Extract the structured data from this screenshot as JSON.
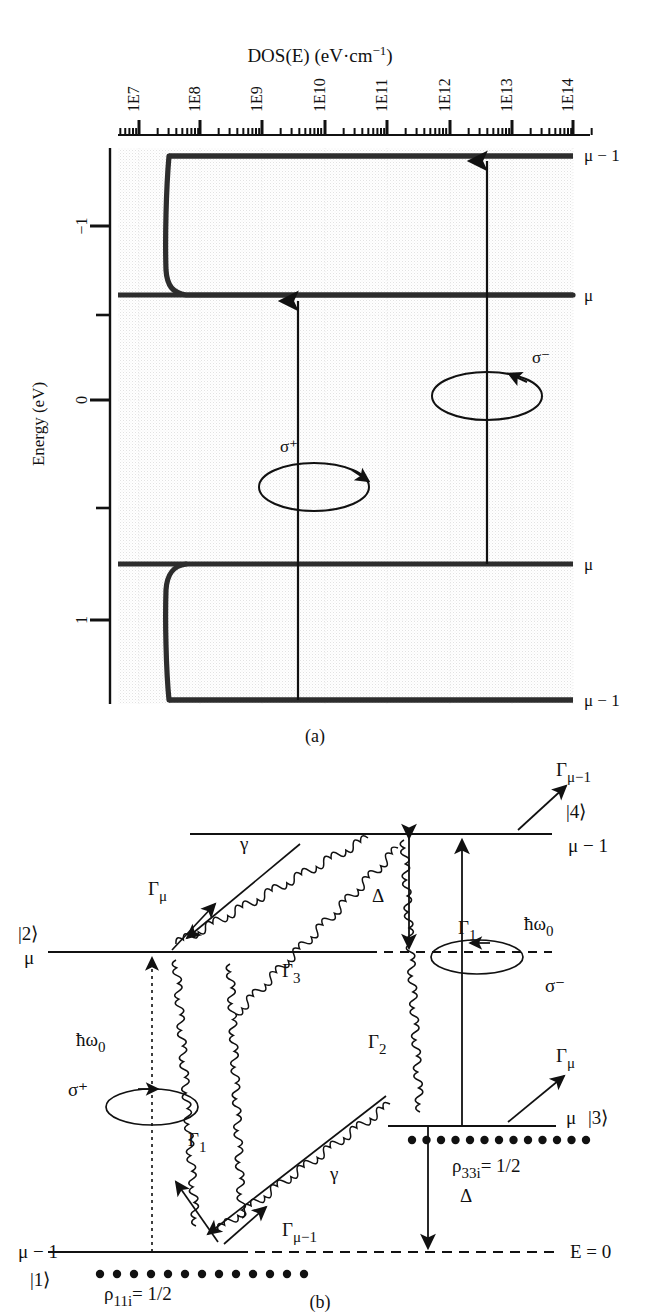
{
  "figure": {
    "panel_a_caption": "(a)",
    "panel_b_caption": "(b)"
  },
  "panel_a": {
    "title": "DOS(E) (eV·cm",
    "title_sup": "−1",
    "title_close": ")",
    "x_axis": {
      "scale": "log",
      "tick_labels": [
        "1E7",
        "1E8",
        "1E9",
        "1E10",
        "1E11",
        "1E12",
        "1E13",
        "1E14"
      ],
      "minor_ticks_per_decade": 9
    },
    "y_axis": {
      "label": "Energy (eV)",
      "tick_labels": [
        "−1",
        "0",
        "1"
      ],
      "minor_tick_count": 2,
      "range": [
        -1.55,
        1.45
      ]
    },
    "right_labels": [
      {
        "text": "μ − 1",
        "level": "top"
      },
      {
        "text": "μ",
        "level": "upper-mu"
      },
      {
        "text": "σ⁻",
        "level": "sigma-minus"
      },
      {
        "text": "μ",
        "level": "lower-mu"
      },
      {
        "text": "μ − 1",
        "level": "bottom"
      }
    ],
    "annotations": [
      {
        "text": "σ⁺",
        "kind": "polarization-label"
      },
      {
        "text": "σ⁻",
        "kind": "polarization-label"
      }
    ]
  },
  "panel_b": {
    "levels": [
      {
        "name": "level-4",
        "left_label": "",
        "right_label": "μ − 1",
        "ket": "|4⟩"
      },
      {
        "name": "level-2",
        "left_label": "μ",
        "ket": "|2⟩"
      },
      {
        "name": "level-3",
        "right_label": "μ",
        "ket": "|3⟩",
        "population": "ρ",
        "population_sub": "33i",
        "population_val": "= 1/2"
      },
      {
        "name": "level-1",
        "left_label": "μ − 1",
        "ket": "|1⟩",
        "population": "ρ",
        "population_sub": "11i",
        "population_val": "= 1/2"
      }
    ],
    "baseline_label": "E = 0",
    "labels": {
      "gamma_mu_1_top": "Γ",
      "gamma_mu_1_top_sub": "μ−1",
      "gamma_mu_left": "Γ",
      "gamma_mu_left_sub": "μ",
      "gamma_mu_right": "Γ",
      "gamma_mu_right_sub": "μ",
      "gamma_mu_1_bottom": "Γ",
      "gamma_mu_1_bottom_sub": "μ−1",
      "gamma1_top": "Γ",
      "gamma1_top_sub": "1",
      "gamma1_bottom": "Γ",
      "gamma1_bottom_sub": "1",
      "gamma2": "Γ",
      "gamma2_sub": "2",
      "gamma3": "Γ",
      "gamma3_sub": "3",
      "gamma_top": "γ",
      "gamma_bottom": "γ",
      "delta_top": "Δ",
      "delta_bottom": "Δ",
      "hbar_left": "ħω",
      "hbar_left_sub": "0",
      "hbar_right": "ħω",
      "hbar_right_sub": "0",
      "sigma_plus": "σ⁺",
      "sigma_minus": "σ⁻"
    }
  },
  "chart_data": {
    "type": "line",
    "xlabel": "DOS(E) (eV·cm⁻¹)",
    "ylabel": "Energy (eV)",
    "xscale": "log",
    "xlim": [
      3200000.0,
      320000000000000.0
    ],
    "ylim": [
      1.45,
      -1.55
    ],
    "xticks": [
      10000000.0,
      100000000.0,
      1000000000.0,
      10000000000.0,
      100000000000.0,
      1000000000000.0,
      10000000000000.0,
      100000000000000.0
    ],
    "xticklabels": [
      "1E7",
      "1E8",
      "1E9",
      "1E10",
      "1E11",
      "1E12",
      "1E13",
      "1E14"
    ],
    "yticks": [
      -1,
      0,
      1
    ],
    "yticklabels": [
      "−1",
      "0",
      "1"
    ],
    "grid": true,
    "legend": "none",
    "series": [
      {
        "name": "upper-band-DOS",
        "comment": "sharp band edge: DOS jumps from ~8e7 at E=mu to saturation ~3e14 at E=mu-1",
        "x": [
          80000000.0,
          86000000.0,
          100000000.0,
          140000000.0,
          300000000.0,
          2000000000.0,
          30000000000.0,
          1000000000000.0,
          300000000000000.0
        ],
        "y": [
          -0.6,
          -0.64,
          -0.72,
          -0.82,
          -0.95,
          -1.12,
          -1.25,
          -1.32,
          -1.35
        ]
      },
      {
        "name": "lower-band-DOS",
        "comment": "mirror image band edge below E=0",
        "x": [
          80000000.0,
          86000000.0,
          100000000.0,
          140000000.0,
          300000000.0,
          2000000000.0,
          30000000000.0,
          1000000000000.0,
          300000000000000.0
        ],
        "y": [
          0.62,
          0.66,
          0.74,
          0.84,
          0.97,
          1.14,
          1.27,
          1.34,
          1.38
        ]
      }
    ],
    "level_lines": [
      {
        "label": "μ − 1",
        "y": -1.35,
        "from_x": 100000000.0,
        "to_x": 320000000000000.0
      },
      {
        "label": "μ",
        "y": -0.6,
        "from_x": 3200000.0,
        "to_x": 320000000000000.0
      },
      {
        "label": "μ",
        "y": 0.62,
        "from_x": 3200000.0,
        "to_x": 320000000000000.0
      },
      {
        "label": "μ − 1",
        "y": 1.38,
        "from_x": 100000000.0,
        "to_x": 320000000000000.0
      }
    ],
    "transition_arrows": [
      {
        "label": "σ⁺",
        "x": 10000000000.0,
        "y_from": 1.38,
        "y_to": -0.6
      },
      {
        "label": "σ⁻",
        "x": 2000000000000.0,
        "y_from": 0.62,
        "y_to": -1.35
      }
    ]
  }
}
